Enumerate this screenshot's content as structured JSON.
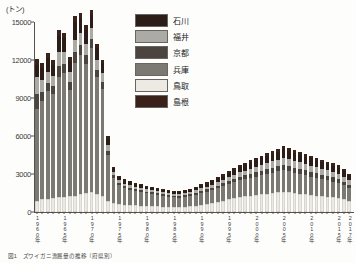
{
  "chart_data": {
    "type": "bar",
    "subtype": "stacked-bar",
    "title": "",
    "unit_label": "(トン)",
    "xlabel": "",
    "ylabel": "",
    "ylim": [
      0,
      15000
    ],
    "yticks": [
      0,
      3000,
      6000,
      9000,
      12000,
      15000
    ],
    "ytick_labels": [
      "0",
      "3000",
      "6000",
      "9000",
      "12000",
      "15000"
    ],
    "grid": false,
    "legend_position": "top-right",
    "stack_order_bottom_to_top": [
      "鳥取",
      "兵庫",
      "京都",
      "福井",
      "石川",
      "島根"
    ],
    "categories": [
      "1960年",
      "1961年",
      "1962年",
      "1963年",
      "1964年",
      "1965年",
      "1966年",
      "1967年",
      "1968年",
      "1969年",
      "1970年",
      "1971年",
      "1972年",
      "1973年",
      "1974年",
      "1975年",
      "1976年",
      "1977年",
      "1978年",
      "1979年",
      "1980年",
      "1981年",
      "1982年",
      "1983年",
      "1984年",
      "1985年",
      "1986年",
      "1987年",
      "1988年",
      "1989年",
      "1990年",
      "1991年",
      "1992年",
      "1993年",
      "1994年",
      "1995年",
      "1996年",
      "1997年",
      "1998年",
      "1999年",
      "2000年",
      "2001年",
      "2002年",
      "2003年",
      "2004年",
      "2005年",
      "2006年",
      "2007年",
      "2008年",
      "2009年",
      "2010年",
      "2011年",
      "2012年",
      "2013年",
      "2014年",
      "2015年",
      "2016年",
      "2017年"
    ],
    "xtick_labels_shown": [
      "1960年",
      "1965年",
      "1970年",
      "1975年",
      "1980年",
      "1985年",
      "1990年",
      "1995年",
      "2000年",
      "2005年",
      "2010年",
      "2015年",
      "2017年"
    ],
    "series": [
      {
        "name": "鳥取",
        "color": "#eceae3",
        "values": [
          900,
          1000,
          1050,
          1100,
          1150,
          1200,
          1250,
          1300,
          1400,
          1500,
          1550,
          1450,
          1300,
          900,
          700,
          600,
          560,
          540,
          520,
          500,
          480,
          460,
          440,
          430,
          420,
          410,
          400,
          420,
          450,
          500,
          560,
          620,
          700,
          800,
          900,
          1000,
          1100,
          1200,
          1250,
          1300,
          1350,
          1400,
          1450,
          1500,
          1550,
          1600,
          1550,
          1500,
          1450,
          1400,
          1350,
          1300,
          1250,
          1200,
          1150,
          1100,
          1000,
          900
        ]
      },
      {
        "name": "兵庫",
        "color": "#7c7872",
        "values": [
          7200,
          7800,
          8500,
          8200,
          9500,
          9800,
          8400,
          10500,
          11000,
          10200,
          11400,
          9200,
          8400,
          3600,
          2000,
          1500,
          1300,
          1200,
          1150,
          1100,
          1000,
          950,
          900,
          850,
          800,
          760,
          740,
          780,
          820,
          880,
          950,
          1000,
          1050,
          1100,
          1150,
          1200,
          1250,
          1300,
          1350,
          1400,
          1450,
          1500,
          1550,
          1600,
          1650,
          1700,
          1650,
          1600,
          1550,
          1500,
          1450,
          1400,
          1350,
          1300,
          1250,
          1200,
          1100,
          1000
        ]
      },
      {
        "name": "京都",
        "color": "#4c443f",
        "values": [
          1200,
          700,
          650,
          620,
          900,
          700,
          600,
          800,
          750,
          700,
          680,
          600,
          550,
          350,
          200,
          180,
          170,
          160,
          150,
          145,
          140,
          135,
          130,
          125,
          120,
          115,
          115,
          120,
          130,
          140,
          150,
          160,
          175,
          190,
          210,
          230,
          250,
          270,
          290,
          310,
          330,
          350,
          370,
          390,
          410,
          430,
          420,
          410,
          400,
          390,
          380,
          370,
          360,
          350,
          340,
          330,
          300,
          270
        ]
      },
      {
        "name": "福井",
        "color": "#abaaa4",
        "values": [
          1400,
          900,
          850,
          800,
          1100,
          950,
          800,
          1000,
          950,
          900,
          880,
          780,
          700,
          450,
          260,
          230,
          215,
          205,
          195,
          190,
          180,
          175,
          170,
          165,
          160,
          155,
          155,
          160,
          170,
          185,
          200,
          215,
          235,
          255,
          280,
          305,
          330,
          355,
          380,
          405,
          430,
          455,
          480,
          505,
          530,
          555,
          545,
          530,
          515,
          500,
          485,
          470,
          455,
          440,
          425,
          410,
          375,
          340
        ]
      },
      {
        "name": "石川",
        "color": "#2d1d18",
        "values": [
          900,
          1000,
          1100,
          900,
          1250,
          1100,
          900,
          1400,
          1200,
          1100,
          1050,
          900,
          800,
          500,
          300,
          260,
          245,
          235,
          225,
          215,
          205,
          200,
          190,
          185,
          180,
          175,
          175,
          185,
          200,
          215,
          235,
          255,
          280,
          305,
          335,
          365,
          395,
          425,
          455,
          485,
          515,
          545,
          575,
          605,
          635,
          665,
          650,
          630,
          610,
          590,
          570,
          550,
          530,
          510,
          490,
          470,
          430,
          390
        ]
      },
      {
        "name": "島根",
        "color": "#3a211a",
        "values": [
          500,
          400,
          380,
          360,
          450,
          400,
          330,
          500,
          450,
          400,
          380,
          330,
          290,
          180,
          110,
          95,
          90,
          85,
          80,
          78,
          75,
          72,
          70,
          68,
          65,
          63,
          63,
          67,
          72,
          78,
          85,
          92,
          100,
          110,
          120,
          132,
          143,
          155,
          165,
          176,
          187,
          198,
          209,
          220,
          230,
          241,
          236,
          229,
          222,
          214,
          207,
          200,
          192,
          185,
          178,
          170,
          156,
          142
        ]
      }
    ],
    "legend_entries": [
      {
        "label": "石川",
        "color": "#2d1d18"
      },
      {
        "label": "福井",
        "color": "#abaaa4"
      },
      {
        "label": "京都",
        "color": "#4c443f"
      },
      {
        "label": "兵庫",
        "color": "#7c7872"
      },
      {
        "label": "鳥取",
        "color": "#eceae3"
      },
      {
        "label": "島根",
        "color": "#3a211a"
      }
    ]
  },
  "caption": {
    "text": "図1　ズワイガニ漁獲量の推移（府県別）"
  }
}
